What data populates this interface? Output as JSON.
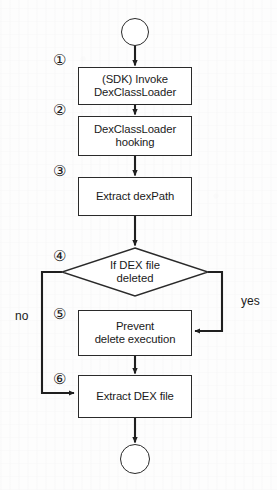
{
  "diagram": {
    "stroke_color": "#2a2a2a",
    "background_color": "#fdfdfd",
    "start_node": {
      "label": "",
      "shape": "circle"
    },
    "end_node": {
      "label": "",
      "shape": "circle"
    },
    "steps": [
      {
        "marker": "①",
        "text_line1": "(SDK) Invoke",
        "text_line2": "DexClassLoader",
        "shape": "process"
      },
      {
        "marker": "②",
        "text_line1": "DexClassLoader",
        "text_line2": "hooking",
        "shape": "process"
      },
      {
        "marker": "③",
        "text_line1": "Extract dexPath",
        "text_line2": "",
        "shape": "process"
      },
      {
        "marker": "④",
        "text_line1": "If DEX file",
        "text_line2": "deleted",
        "shape": "decision"
      },
      {
        "marker": "⑤",
        "text_line1": "Prevent",
        "text_line2": "delete execution",
        "shape": "process"
      },
      {
        "marker": "⑥",
        "text_line1": "Extract DEX file",
        "text_line2": "",
        "shape": "process"
      }
    ],
    "branches": {
      "no_label": "no",
      "yes_label": "yes"
    }
  }
}
